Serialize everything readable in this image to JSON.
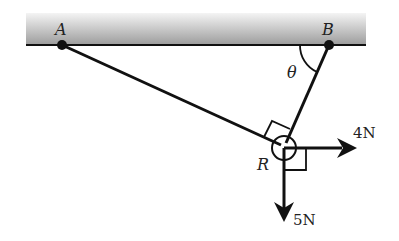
{
  "diagram": {
    "type": "statics-force-diagram",
    "ceiling": {
      "label": "ceiling"
    },
    "points": {
      "A": {
        "label": "A"
      },
      "B": {
        "label": "B"
      },
      "R": {
        "label": "R"
      }
    },
    "angle": {
      "label": "θ",
      "between": [
        "ceiling",
        "string BR"
      ]
    },
    "forces": [
      {
        "label": "4N",
        "direction": "right"
      },
      {
        "label": "5N",
        "direction": "down"
      }
    ],
    "right_angles": [
      "AR ⟂ BR",
      "4N ⟂ 5N"
    ],
    "colors": {
      "line": "#111111",
      "ceiling_top": "#f2f2f2",
      "ceiling_bottom": "#9a9a9a",
      "text": "#222222"
    }
  }
}
